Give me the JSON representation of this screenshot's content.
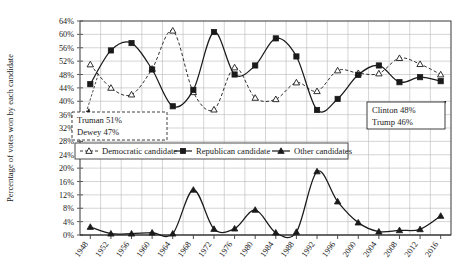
{
  "chart_data": {
    "type": "line",
    "title": "",
    "xlabel": "",
    "ylabel": "Percentage of votes won by each candidate",
    "ylim": [
      0,
      64
    ],
    "ytick_step": 4,
    "grid": true,
    "legend_position": "middle-left-inside",
    "categories": [
      "1948",
      "1952",
      "1956",
      "1960",
      "1964",
      "1968",
      "1972",
      "1976",
      "1980",
      "1984",
      "1988",
      "1992",
      "1996",
      "2000",
      "2004",
      "2008",
      "2012",
      "2016"
    ],
    "yticks": [
      "0%",
      "4%",
      "8%",
      "12%",
      "16%",
      "20%",
      "24%",
      "28%",
      "32%",
      "36%",
      "40%",
      "44%",
      "48%",
      "52%",
      "56%",
      "60%",
      "64%"
    ],
    "series": [
      {
        "name": "Democratic candidate",
        "marker": "open-triangle",
        "line": "dashed",
        "values": [
          51.0,
          44.0,
          42.0,
          49.7,
          61.1,
          42.7,
          37.5,
          50.1,
          41.0,
          40.6,
          45.6,
          43.0,
          49.2,
          48.4,
          48.3,
          52.9,
          51.1,
          48.0
        ]
      },
      {
        "name": "Republican candidate",
        "marker": "filled-square",
        "line": "solid",
        "values": [
          45.1,
          55.2,
          57.4,
          49.5,
          38.5,
          43.4,
          60.7,
          48.0,
          50.7,
          58.8,
          53.4,
          37.4,
          40.7,
          47.9,
          50.7,
          45.7,
          47.2,
          46.0
        ]
      },
      {
        "name": "Other candidates",
        "marker": "filled-triangle",
        "line": "solid",
        "values": [
          2.4,
          0.4,
          0.4,
          0.7,
          0.4,
          13.5,
          1.8,
          1.9,
          7.5,
          0.7,
          0.9,
          19.0,
          10.0,
          3.7,
          1.0,
          1.4,
          1.7,
          5.7
        ]
      }
    ],
    "annotations": [
      {
        "id": "truman-dewey",
        "style": "dashed-box",
        "lines": [
          "Truman 51%",
          "Dewey 47%"
        ],
        "points_to": "1948"
      },
      {
        "id": "clinton-trump",
        "style": "solid-box",
        "lines": [
          "Clinton 48%",
          "Trump 46%"
        ],
        "points_to": "2016"
      }
    ]
  },
  "legend": {
    "items": [
      {
        "label": "Democratic candidate",
        "marker": "open-triangle"
      },
      {
        "label": "Republican candidate",
        "marker": "filled-square"
      },
      {
        "label": "Other candidates",
        "marker": "filled-triangle"
      }
    ]
  }
}
